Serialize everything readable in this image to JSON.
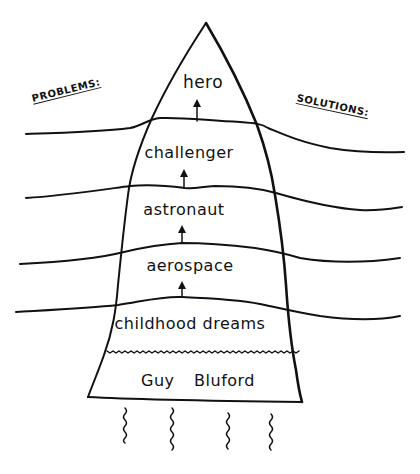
{
  "diagram": {
    "side_labels": {
      "left": "PROBLEMS:",
      "right": "SOLUTIONS:"
    },
    "stages": [
      {
        "label": "hero",
        "order": 6
      },
      {
        "label": "challenger",
        "order": 5
      },
      {
        "label": "astronaut",
        "order": 4
      },
      {
        "label": "aerospace",
        "order": 3
      },
      {
        "label": "childhood dreams",
        "order": 2
      },
      {
        "label": "Guy Bluford",
        "order": 1
      }
    ],
    "arrows": [
      {
        "from": "challenger",
        "to": "hero"
      },
      {
        "from": "astronaut",
        "to": "challenger"
      },
      {
        "from": "aerospace",
        "to": "astronaut"
      },
      {
        "from": "childhood dreams",
        "to": "aerospace"
      }
    ],
    "flames": 4,
    "colors": {
      "ink": "#111111",
      "paper": "#ffffff"
    }
  }
}
